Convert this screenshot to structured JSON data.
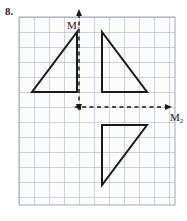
{
  "figure": {
    "problem_number": "8.",
    "caption_alt": "Grid with three right triangles and two mirror lines M1 and M2",
    "axes": [
      {
        "name": "M1",
        "label": "M",
        "subscript": "1",
        "orientation": "vertical",
        "style": "dashed",
        "x": 79,
        "y_start": 11,
        "y_end": 107,
        "arrow_top": true,
        "arrow_bottom": true,
        "label_x": 67,
        "label_y": 20
      },
      {
        "name": "M2",
        "label": "M",
        "subscript": "2",
        "orientation": "horizontal",
        "style": "dashed",
        "y": 107,
        "x_start": 79,
        "x_end": 172,
        "arrow_right": true,
        "arrow_left": true,
        "label_x": 170,
        "label_y": 112
      }
    ],
    "grid": {
      "x_min": 19,
      "x_max": 175,
      "y_min": 17,
      "y_max": 205,
      "cell_size": 15,
      "columns": 10,
      "rows": 12,
      "line_color": "#9aa0ad",
      "background": "#fbfbfc",
      "visible": true
    },
    "shapes": [
      {
        "name": "triangle-upper-left",
        "type": "right-triangle",
        "points": "32,92 77,92 77,32",
        "stroke": "#1a1a1a",
        "stroke_width": 2,
        "fill": "none",
        "right_angle_at": "77,92"
      },
      {
        "name": "triangle-upper-right",
        "type": "right-triangle",
        "points": "102,32 102,92 147,92",
        "stroke": "#1a1a1a",
        "stroke_width": 2,
        "fill": "none",
        "right_angle_at": "102,92"
      },
      {
        "name": "triangle-lower-right",
        "type": "right-triangle",
        "points": "102,125 147,125 102,185",
        "stroke": "#1a1a1a",
        "stroke_width": 2,
        "fill": "none",
        "right_angle_at": "102,125"
      }
    ]
  },
  "chart_data": {
    "type": "diagram",
    "title": "",
    "grid": {
      "cell_size": 15,
      "columns": 10,
      "rows": 12
    },
    "mirror_lines": [
      {
        "label": "M1",
        "orientation": "vertical",
        "grid_x": 4
      },
      {
        "label": "M2",
        "orientation": "horizontal",
        "grid_y": 6
      }
    ],
    "triangles": [
      {
        "name": "pre-image",
        "grid_vertices": [
          [
            1,
            5
          ],
          [
            4,
            5
          ],
          [
            4,
            1
          ]
        ]
      },
      {
        "name": "image-across-M1",
        "grid_vertices": [
          [
            5,
            1
          ],
          [
            5,
            5
          ],
          [
            8,
            5
          ]
        ]
      },
      {
        "name": "image-across-M2",
        "grid_vertices": [
          [
            5,
            7
          ],
          [
            8,
            7
          ],
          [
            5,
            11
          ]
        ]
      }
    ]
  }
}
